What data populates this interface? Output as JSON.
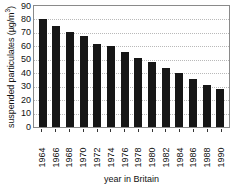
{
  "chart_data": {
    "type": "bar",
    "title": "",
    "subtitle": "",
    "xlabel": "year in Britain",
    "ylabel": "suspended particulates (µg/m³)",
    "ylabel_main": "suspended particulates (µg/m",
    "ylabel_superscript": "3",
    "ylabel_tail": ")",
    "categories": [
      "1964",
      "1966",
      "1968",
      "1970",
      "1972",
      "1974",
      "1976",
      "1978",
      "1980",
      "1982",
      "1984",
      "1986",
      "1988",
      "1990"
    ],
    "values": [
      80,
      75,
      71,
      68,
      62,
      60,
      56,
      51,
      48,
      44,
      40,
      36,
      31,
      28
    ],
    "ylim": [
      0,
      90
    ],
    "ytick_values": [
      90,
      80,
      70,
      60,
      50,
      40,
      30,
      20,
      10,
      0
    ],
    "ytick_labels": [
      "90",
      "80",
      "70",
      "60",
      "50",
      "40",
      "30",
      "20",
      "10",
      "0"
    ],
    "grid": "horizontal-dotted",
    "legend": "none",
    "bar_color": "#161616",
    "frame_color": "#8a8a8a",
    "gridline_color": "#b9b9b9",
    "background_color": "#ffffff",
    "series": [
      {
        "name": "suspended particulates",
        "values": [
          80,
          75,
          71,
          68,
          62,
          60,
          56,
          51,
          48,
          44,
          40,
          36,
          31,
          28
        ]
      }
    ]
  }
}
